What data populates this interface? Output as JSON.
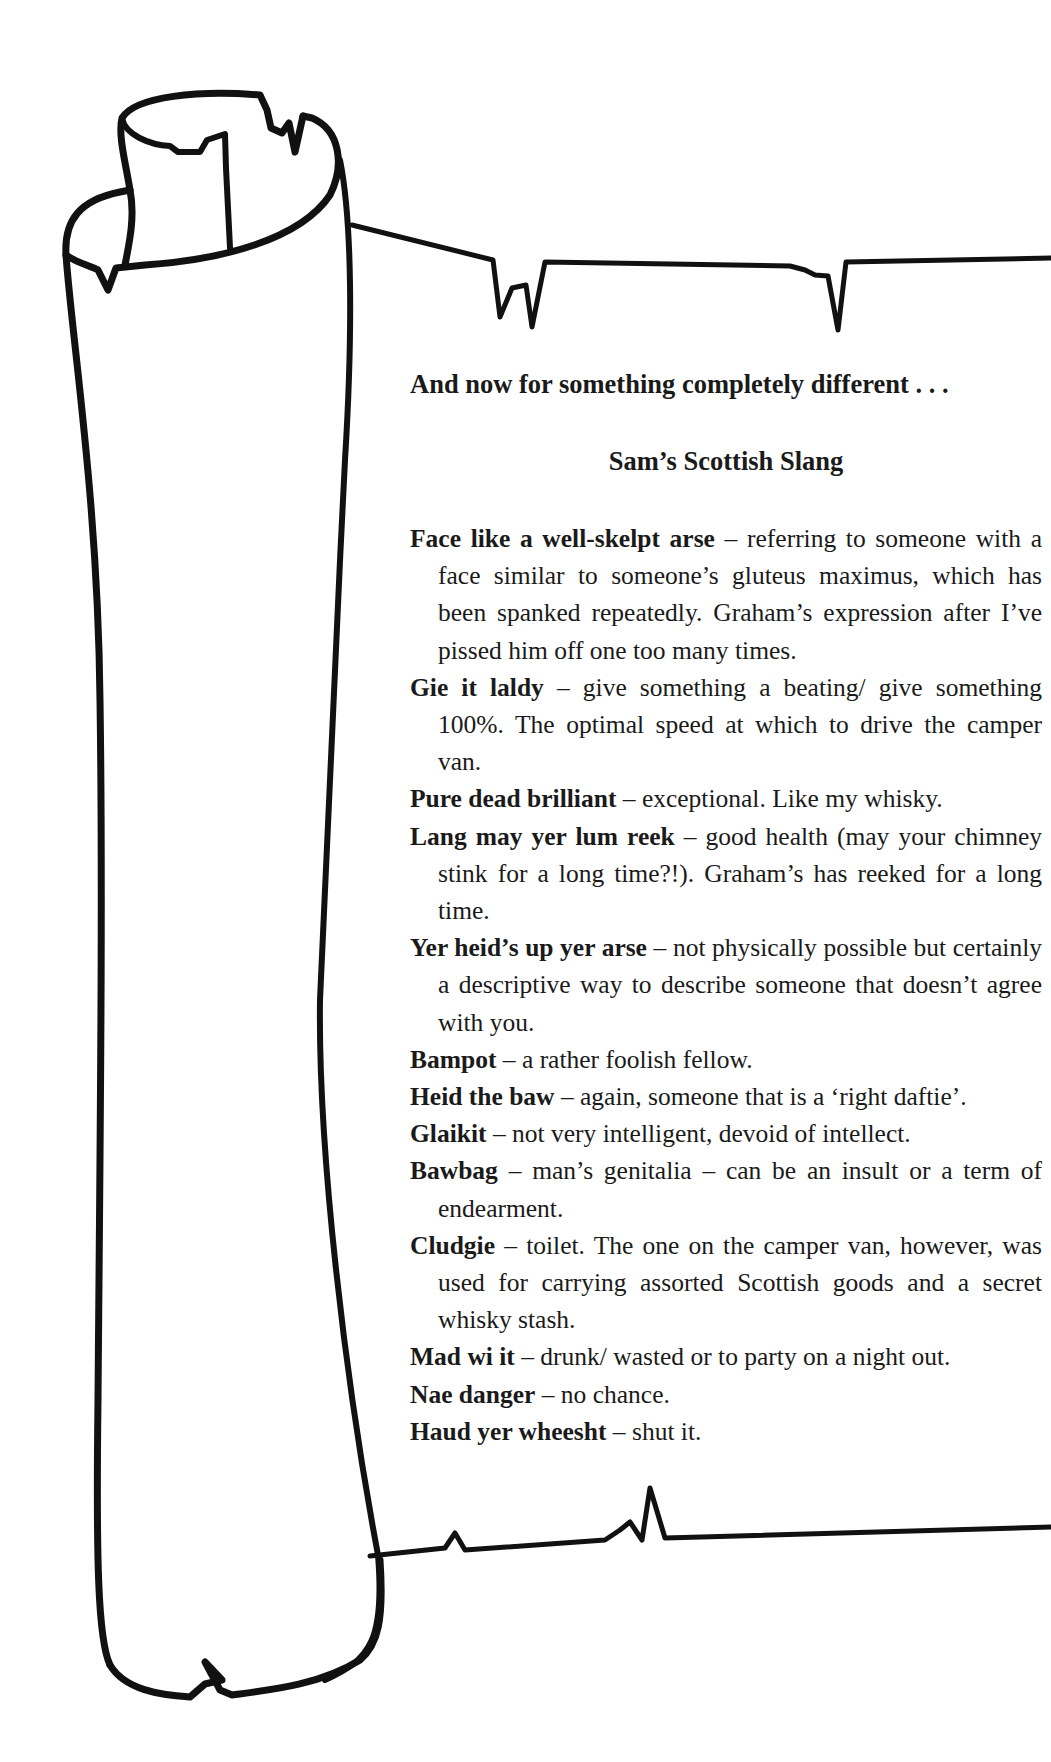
{
  "page": {
    "heading": "And now for something completely different . . .",
    "subheading": "Sam’s Scottish Slang",
    "entries": [
      {
        "term": "Face like a well-skelpt arse",
        "definition": "referring to someone with a face similar to someone’s gluteus maximus, which has been spanked repeatedly. Graham’s expression after I’ve pissed him off one too many times."
      },
      {
        "term": "Gie it laldy",
        "definition": "give something a beating/ give something 100%. The optimal speed at which to drive the camper van."
      },
      {
        "term": "Pure dead brilliant",
        "definition": "exceptional. Like my whisky."
      },
      {
        "term": "Lang may yer lum reek",
        "definition": "good health (may your chimney stink for a long time?!). Graham’s has reeked for a long time."
      },
      {
        "term": "Yer heid’s up yer arse",
        "definition": "not physically possible but certainly a descriptive way to describe someone that doesn’t agree with you."
      },
      {
        "term": "Bampot",
        "definition": "a rather foolish fellow."
      },
      {
        "term": "Heid the baw",
        "definition": "again, someone that is a ‘right daftie’."
      },
      {
        "term": "Glaikit",
        "definition": "not very intelligent, devoid of intellect."
      },
      {
        "term": "Bawbag",
        "definition": "man’s genitalia – can be an insult or a term of endearment."
      },
      {
        "term": "Cludgie",
        "definition": "toilet. The one on the camper van, however, was used for carrying assorted Scottish goods and a secret whisky stash."
      },
      {
        "term": "Mad wi it",
        "definition": "drunk/ wasted or to party on a night out."
      },
      {
        "term": "Nae danger",
        "definition": "no chance."
      },
      {
        "term": "Haud yer wheesht",
        "definition": "shut it."
      }
    ],
    "separator": " – "
  },
  "illustration": {
    "name": "scroll-illustration",
    "stroke_color": "#111111",
    "background_color": "#ffffff"
  }
}
